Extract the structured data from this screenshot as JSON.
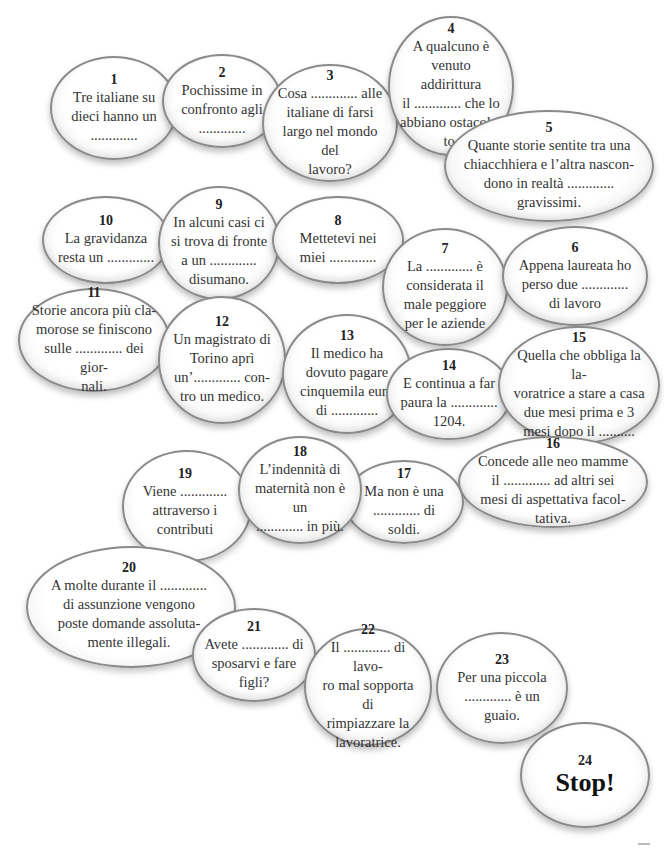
{
  "bubbles": [
    {
      "num": "1",
      "text": "Tre italiane su\ndieci hanno un\n............."
    },
    {
      "num": "2",
      "text": "Pochissime in\nconfronto agli\n............."
    },
    {
      "num": "3",
      "text": "Cosa ............. alle\nitaliane di farsi\nlargo nel mondo del\nlavoro?"
    },
    {
      "num": "4",
      "text": "A qualcuno è\nvenuto addirittura\nil ............. che lo\nabbiano ostacola-\nto."
    },
    {
      "num": "5",
      "text": "Quante storie sentite tra una\nchiacchhiera e l’altra nascon-\ndono in realtà .............\ngravissimi."
    },
    {
      "num": "6",
      "text": "Appena laureata ho\nperso due .............\ndi lavoro"
    },
    {
      "num": "7",
      "text": "La ............. è\nconsiderata il\nmale peggiore\nper le aziende"
    },
    {
      "num": "8",
      "text": "Mettetevi nei\nmiei ............."
    },
    {
      "num": "9",
      "text": "In alcuni casi ci\nsi trova di fronte\na un .............\ndisumano."
    },
    {
      "num": "10",
      "text": "La gravidanza\nresta un ............."
    },
    {
      "num": "11",
      "text": "Storie ancora più cla-\nmorose se finiscono\nsulle ............. dei gior-\nnali."
    },
    {
      "num": "12",
      "text": "Un magistrato di\nTorino aprì\nun’............. con-\ntro un medico."
    },
    {
      "num": "13",
      "text": "Il medico ha\ndovuto pagare\ncinquemila euro\ndi ............."
    },
    {
      "num": "14",
      "text": "E continua a far\npaura la .............\n1204."
    },
    {
      "num": "15",
      "text": "Quella che obbliga la la-\nvoratrice a stare a casa\ndue mesi prima e 3\nmesi dopo il .........."
    },
    {
      "num": "16",
      "text": "Concede alle neo mamme\nil ............. ad altri sei\nmesi di aspettativa facol-\ntativa."
    },
    {
      "num": "17",
      "text": "Ma non è una\n............. di soldi."
    },
    {
      "num": "18",
      "text": "L’indennità di\nmaternità non è un\n............. in più."
    },
    {
      "num": "19",
      "text": "Viene .............\nattraverso i\ncontributi"
    },
    {
      "num": "20",
      "text": "A molte durante il .............\ndi assunzione vengono\nposte domande assoluta-\nmente illegali."
    },
    {
      "num": "21",
      "text": "Avete ............. di\nsposarvi e fare\nfigli?"
    },
    {
      "num": "22",
      "text": "Il ............. di lavo-\nro mal sopporta di\nrimpiazzare la\nlavoratrice."
    },
    {
      "num": "23",
      "text": "Per una piccola\n............. è un\nguaio."
    },
    {
      "num": "24",
      "text": "Stop!"
    }
  ]
}
